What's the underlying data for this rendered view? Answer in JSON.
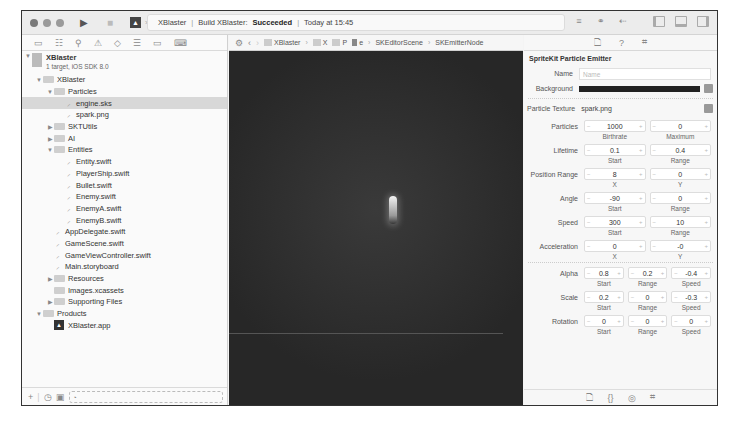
{
  "titlebar": {
    "scheme_target": "XBlaster",
    "activity_project": "XBlaster",
    "activity_build_prefix": "Build XBlaster:",
    "activity_status": "Succeeded",
    "activity_time": "Today at 15:45",
    "separator": "|"
  },
  "icons": {
    "run": "▶",
    "stop": "■",
    "editor_standard": "≡",
    "editor_assistant": "⚭",
    "editor_version": "⇠",
    "back": "‹",
    "forward": "›",
    "chevron": "›",
    "disclosure_open": "▼",
    "disclosure_closed": "▶"
  },
  "navigator": {
    "tabs": [
      "▭",
      "☷",
      "⚲",
      "⚠",
      "◇",
      "☰",
      "▭",
      "⌨"
    ],
    "project": {
      "name": "XBlaster",
      "subtitle": "1 target, iOS SDK 8.0"
    },
    "items": [
      {
        "label": "XBlaster",
        "type": "folder",
        "indent": 1,
        "open": true
      },
      {
        "label": "Particles",
        "type": "folder",
        "indent": 2,
        "open": true
      },
      {
        "label": "engine.sks",
        "type": "file",
        "indent": 3,
        "selected": true
      },
      {
        "label": "spark.png",
        "type": "file",
        "indent": 3
      },
      {
        "label": "SKTUtils",
        "type": "folder",
        "indent": 2,
        "open": false
      },
      {
        "label": "AI",
        "type": "folder",
        "indent": 2,
        "open": false
      },
      {
        "label": "Entities",
        "type": "folder",
        "indent": 2,
        "open": true
      },
      {
        "label": "Entity.swift",
        "type": "file",
        "indent": 3
      },
      {
        "label": "PlayerShip.swift",
        "type": "file",
        "indent": 3
      },
      {
        "label": "Bullet.swift",
        "type": "file",
        "indent": 3
      },
      {
        "label": "Enemy.swift",
        "type": "file",
        "indent": 3
      },
      {
        "label": "EnemyA.swift",
        "type": "file",
        "indent": 3
      },
      {
        "label": "EnemyB.swift",
        "type": "file",
        "indent": 3
      },
      {
        "label": "AppDelegate.swift",
        "type": "file",
        "indent": 2
      },
      {
        "label": "GameScene.swift",
        "type": "file",
        "indent": 2
      },
      {
        "label": "GameViewController.swift",
        "type": "file",
        "indent": 2
      },
      {
        "label": "Main.storyboard",
        "type": "file",
        "indent": 2
      },
      {
        "label": "Resources",
        "type": "folder",
        "indent": 2,
        "open": false
      },
      {
        "label": "Images.xcassets",
        "type": "folder",
        "indent": 2
      },
      {
        "label": "Supporting Files",
        "type": "folder",
        "indent": 2,
        "open": false
      },
      {
        "label": "Products",
        "type": "folder",
        "indent": 1,
        "open": true
      },
      {
        "label": "XBlaster.app",
        "type": "app",
        "indent": 2
      }
    ],
    "footer": {
      "add": "+",
      "recent": "◷",
      "scm": "▣",
      "filter_icon": "◔"
    }
  },
  "jumpbar": {
    "crumbs": [
      "XBlaster",
      "X",
      "P",
      "e",
      "SKEditorScene",
      "SKEmitterNode"
    ]
  },
  "inspector": {
    "tabs": [
      "🗋",
      "?",
      "⌗"
    ],
    "title": "SpriteKit Particle Emitter",
    "name_label": "Name",
    "name_placeholder": "Name",
    "background_label": "Background",
    "texture_label": "Particle Texture",
    "texture_value": "spark.png",
    "groups": [
      {
        "label": "Particles",
        "cells": [
          {
            "value": "1000",
            "sub": "Birthrate"
          },
          {
            "value": "0",
            "sub": "Maximum"
          }
        ]
      },
      {
        "label": "Lifetime",
        "cells": [
          {
            "value": "0.1",
            "sub": "Start"
          },
          {
            "value": "0.4",
            "sub": "Range"
          }
        ]
      },
      {
        "label": "Position Range",
        "cells": [
          {
            "value": "8",
            "sub": "X"
          },
          {
            "value": "0",
            "sub": "Y"
          }
        ]
      },
      {
        "label": "Angle",
        "cells": [
          {
            "value": "-90",
            "sub": "Start"
          },
          {
            "value": "0",
            "sub": "Range"
          }
        ]
      },
      {
        "label": "Speed",
        "cells": [
          {
            "value": "300",
            "sub": "Start"
          },
          {
            "value": "10",
            "sub": "Range"
          }
        ]
      },
      {
        "label": "Acceleration",
        "cells": [
          {
            "value": "0",
            "sub": "X"
          },
          {
            "value": "-0",
            "sub": "Y"
          }
        ]
      },
      {
        "label": "Alpha",
        "cells": [
          {
            "value": "0.8",
            "sub": "Start"
          },
          {
            "value": "0.2",
            "sub": "Range"
          },
          {
            "value": "-0.4",
            "sub": "Speed"
          }
        ]
      },
      {
        "label": "Scale",
        "cells": [
          {
            "value": "0.2",
            "sub": "Start"
          },
          {
            "value": "0",
            "sub": "Range"
          },
          {
            "value": "-0.3",
            "sub": "Speed"
          }
        ]
      },
      {
        "label": "Rotation",
        "cells": [
          {
            "value": "0",
            "sub": "Start"
          },
          {
            "value": "0",
            "sub": "Range"
          },
          {
            "value": "0",
            "sub": "Speed"
          }
        ]
      }
    ],
    "footer_tabs": [
      "🗋",
      "{}",
      "◎",
      "⌗"
    ]
  }
}
